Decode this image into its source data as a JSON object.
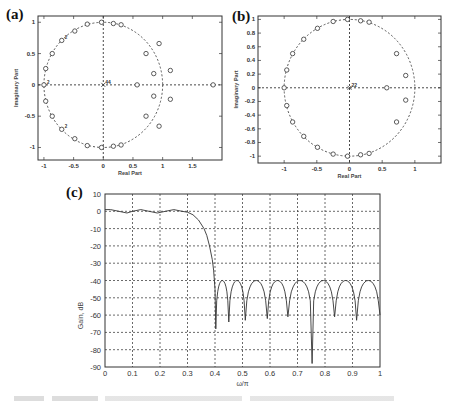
{
  "panels": {
    "a": {
      "label": "(a)",
      "xlabel": "Real Part",
      "ylabel": "Imaginary Part",
      "xticks": [
        "-1",
        "-0.5",
        "0",
        "0.5",
        "1",
        "1.5"
      ],
      "yticks": [
        "1",
        "0.5",
        "0",
        "-0.5",
        "-1"
      ],
      "origin_annotation": "44",
      "multiplicity_annotations": [
        "2",
        "2",
        "2"
      ]
    },
    "b": {
      "label": "(b)",
      "xlabel": "Real Part",
      "ylabel": "Imaginary Part",
      "xticks": [
        "-1",
        "-0.5",
        "0",
        "0.5",
        "1"
      ],
      "yticks": [
        "1",
        "0.8",
        "0.6",
        "0.4",
        "0.2",
        "0",
        "-0.2",
        "-0.4",
        "-0.6",
        "-0.8",
        "-1"
      ],
      "origin_annotation": "22"
    },
    "c": {
      "label": "(c)",
      "xlabel": "ω/π",
      "ylabel": "Gain, dB",
      "xticks": [
        "0",
        "0.1",
        "0.2",
        "0.3",
        "0.4",
        "0.5",
        "0.6",
        "0.7",
        "0.8",
        "0.9",
        "1"
      ],
      "yticks": [
        "10",
        "0",
        "-10",
        "-20",
        "-30",
        "-40",
        "-50",
        "-60",
        "-70",
        "-80",
        "-90"
      ]
    }
  },
  "chart_data": [
    {
      "type": "scatter",
      "title": "(a)",
      "xlabel": "Real Part",
      "ylabel": "Imaginary Part",
      "xlim": [
        -1.1,
        2.0
      ],
      "ylim": [
        -1.2,
        1.1
      ],
      "grid": false,
      "unit_circle": true,
      "origin_pole_count": 44,
      "zeros": [
        [
          -0.03,
          1.0
        ],
        [
          0.17,
          0.98
        ],
        [
          0.3,
          0.96
        ],
        [
          -0.27,
          0.97
        ],
        [
          -0.48,
          0.86
        ],
        [
          -0.7,
          0.71
        ],
        [
          -0.86,
          0.5
        ],
        [
          -0.97,
          0.26
        ],
        [
          -1.0,
          0.0
        ],
        [
          -0.97,
          -0.26
        ],
        [
          -0.86,
          -0.5
        ],
        [
          -0.7,
          -0.71
        ],
        [
          -0.48,
          -0.86
        ],
        [
          -0.27,
          -0.97
        ],
        [
          -0.03,
          -1.0
        ],
        [
          0.17,
          -0.98
        ],
        [
          0.3,
          -0.96
        ],
        [
          0.72,
          0.5
        ],
        [
          0.94,
          0.66
        ],
        [
          0.85,
          0.18
        ],
        [
          1.13,
          0.23
        ],
        [
          0.57,
          0.0
        ],
        [
          1.85,
          0.0
        ],
        [
          0.85,
          -0.18
        ],
        [
          1.13,
          -0.23
        ],
        [
          0.72,
          -0.5
        ],
        [
          0.94,
          -0.66
        ]
      ]
    },
    {
      "type": "scatter",
      "title": "(b)",
      "xlabel": "Real Part",
      "ylabel": "Imaginary Part",
      "xlim": [
        -1.4,
        1.4
      ],
      "ylim": [
        -1.1,
        1.05
      ],
      "grid": false,
      "unit_circle": true,
      "origin_pole_count": 22,
      "zeros": [
        [
          -0.03,
          1.0
        ],
        [
          0.17,
          0.98
        ],
        [
          0.3,
          0.96
        ],
        [
          -0.25,
          0.97
        ],
        [
          -0.49,
          0.87
        ],
        [
          -0.7,
          0.71
        ],
        [
          -0.87,
          0.5
        ],
        [
          -0.96,
          0.26
        ],
        [
          -1.0,
          0.0
        ],
        [
          -0.96,
          -0.26
        ],
        [
          -0.87,
          -0.5
        ],
        [
          -0.7,
          -0.71
        ],
        [
          -0.49,
          -0.87
        ],
        [
          -0.25,
          -0.97
        ],
        [
          -0.03,
          -1.0
        ],
        [
          0.17,
          -0.98
        ],
        [
          0.3,
          -0.96
        ],
        [
          0.72,
          0.5
        ],
        [
          0.86,
          0.18
        ],
        [
          0.57,
          0.0
        ],
        [
          0.86,
          -0.18
        ],
        [
          0.72,
          -0.5
        ]
      ]
    },
    {
      "type": "line",
      "title": "(c)",
      "xlabel": "ω/π",
      "ylabel": "Gain, dB",
      "xlim": [
        0,
        1
      ],
      "ylim": [
        -90,
        10
      ],
      "grid": true,
      "series": [
        {
          "name": "Gain response",
          "x": [
            0,
            0.02,
            0.05,
            0.08,
            0.1,
            0.13,
            0.16,
            0.19,
            0.22,
            0.25,
            0.28,
            0.3,
            0.32,
            0.34,
            0.36,
            0.37,
            0.38,
            0.39,
            0.395,
            0.4,
            0.403
          ],
          "y": [
            1,
            1,
            0,
            -1,
            0,
            1,
            0,
            -1,
            0,
            1,
            0,
            -0.5,
            -2,
            -5,
            -10,
            -14,
            -20,
            -28,
            -34,
            -45,
            -68
          ]
        }
      ],
      "stopband": {
        "peak_level_db": -40,
        "notch_frequencies": [
          0.403,
          0.45,
          0.51,
          0.59,
          0.665,
          0.753,
          0.835,
          0.915,
          1.0
        ],
        "notch_depths_db": [
          -68,
          -64,
          -63,
          -62,
          -61,
          -88,
          -61,
          -63,
          -60
        ]
      },
      "passband_ripple_db": [
        -1,
        1
      ]
    }
  ]
}
